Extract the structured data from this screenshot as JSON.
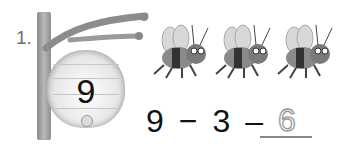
{
  "worksheet": {
    "problem_number": "1.",
    "hive": {
      "count": "9"
    },
    "bees": {
      "count": 3
    },
    "equation": {
      "minuend": "9",
      "operator": "−",
      "subtrahend": "3",
      "equals_sign": "–",
      "answer": "6"
    }
  }
}
